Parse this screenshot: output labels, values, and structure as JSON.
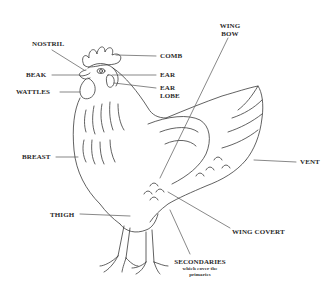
{
  "diagram": {
    "stroke_color": "#3a3a3a",
    "label_color": "#2a2a2a",
    "background": "#ffffff"
  },
  "labels": {
    "nostril": "NOSTRIL",
    "comb": "COMB",
    "beak": "BEAK",
    "ear": "EAR",
    "wattles": "WATTLES",
    "ear_lobe_line1": "EAR",
    "ear_lobe_line2": "LOBE",
    "wing_bow_line1": "WING",
    "wing_bow_line2": "BOW",
    "breast": "BREAST",
    "vent": "VENT",
    "thigh": "THIGH",
    "wing_covert": "WING COVERT",
    "secondaries": "SECONDARIES",
    "secondaries_note_line1": "which cover the",
    "secondaries_note_line2": "primaries"
  }
}
